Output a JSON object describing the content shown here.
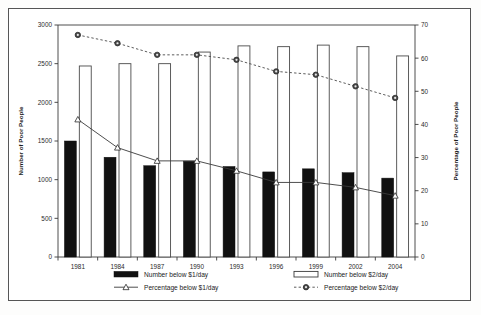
{
  "chart_data": {
    "type": "bar",
    "title": "",
    "xlabel": "",
    "ylabel": "Number of Poor People",
    "y2label": "Percentage of Poor People",
    "categories": [
      "1981",
      "1984",
      "1987",
      "1990",
      "1993",
      "1996",
      "1999",
      "2002",
      "2004"
    ],
    "ylim": [
      0,
      3000
    ],
    "y2lim": [
      0,
      70
    ],
    "yticks": [
      "0",
      "500",
      "1000",
      "1500",
      "2000",
      "2500",
      "3000"
    ],
    "ytick_values": [
      0,
      500,
      1000,
      1500,
      2000,
      2500,
      3000
    ],
    "y2ticks": [
      "0",
      "10",
      "20",
      "30",
      "40",
      "50",
      "60",
      "70"
    ],
    "y2tick_values": [
      0,
      10,
      20,
      30,
      40,
      50,
      60,
      70
    ],
    "grid": false,
    "legend_position": "bottom",
    "series": [
      {
        "name": "Number below $1/day",
        "kind": "bar",
        "style": "filled-black",
        "axis": "left",
        "values": [
          1500,
          1290,
          1180,
          1240,
          1170,
          1100,
          1140,
          1090,
          1020
        ]
      },
      {
        "name": "Number below $2/day",
        "kind": "bar",
        "style": "open-white",
        "axis": "left",
        "values": [
          2470,
          2500,
          2500,
          2650,
          2730,
          2720,
          2740,
          2720,
          2600
        ]
      },
      {
        "name": "Percentage below $1/day",
        "kind": "line",
        "style": "solid-triangle",
        "axis": "right",
        "values": [
          41.5,
          33.0,
          29.0,
          29.0,
          26.0,
          22.5,
          22.5,
          21.0,
          18.5
        ]
      },
      {
        "name": "Percentage below $2/day",
        "kind": "line",
        "style": "dotted-circle",
        "axis": "right",
        "values": [
          67.0,
          64.5,
          61.0,
          61.0,
          59.5,
          56.0,
          55.0,
          51.5,
          48.0
        ]
      }
    ]
  },
  "legend": {
    "items": [
      {
        "label": "Number below $1/day",
        "marker": "filled-square-swatch"
      },
      {
        "label": "Number below $2/day",
        "marker": "open-square-swatch"
      },
      {
        "label": "Percentage below $1/day",
        "marker": "solid-line-triangle"
      },
      {
        "label": "Percentage below $2/day",
        "marker": "dotted-line-circle"
      }
    ]
  },
  "colors": {
    "bar_dollar1": "#111111",
    "bar_dollar2": "#ffffff",
    "line_pct1": "#3a3a3a",
    "line_pct2": "#4a4a4a",
    "axis": "#3a3a3a",
    "frame": "#555555",
    "background": "#ffffff"
  }
}
